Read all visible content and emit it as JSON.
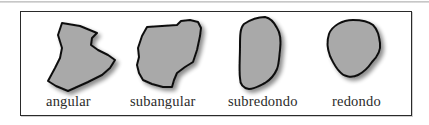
{
  "figure": {
    "title": "",
    "colors": {
      "frame": "#2a2a2a",
      "shape_fill": "#a9a9a9",
      "shape_stroke": "#111111",
      "label_text": "#2b2b2b"
    },
    "items": [
      {
        "id": "angular",
        "label": "angular",
        "shape": "angular-grain-icon"
      },
      {
        "id": "subangular",
        "label": "subangular",
        "shape": "subangular-grain-icon"
      },
      {
        "id": "subredondo",
        "label": "subredondo",
        "shape": "subrounded-grain-icon"
      },
      {
        "id": "redondo",
        "label": "redondo",
        "shape": "rounded-grain-icon"
      }
    ]
  }
}
